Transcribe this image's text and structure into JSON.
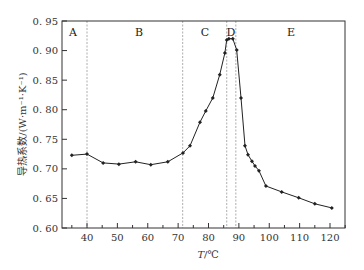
{
  "chart_data": {
    "type": "line",
    "title": "",
    "xlabel": "T/℃",
    "ylabel": "导热系数/(W·m⁻¹·K⁻¹)",
    "xlim": [
      33,
      125
    ],
    "ylim": [
      0.6,
      0.95
    ],
    "x_ticks": [
      40,
      50,
      60,
      70,
      80,
      90,
      100,
      110,
      120
    ],
    "y_ticks": [
      "0.60",
      "0.65",
      "0.70",
      "0.75",
      "0.80",
      "0.85",
      "0.90",
      "0.95"
    ],
    "grid": false,
    "legend": null,
    "region_boundaries": [
      40,
      71.5,
      86,
      89
    ],
    "regions": [
      "A",
      "B",
      "C",
      "D",
      "E"
    ],
    "series": [
      {
        "name": "thermal conductivity",
        "x": [
          35,
          40,
          45.3,
          50.5,
          56,
          61,
          66.6,
          71.6,
          73.9,
          77.2,
          79.1,
          81.4,
          83.7,
          85.4,
          86,
          86.7,
          88,
          89.3,
          90.7,
          92,
          93,
          94.3,
          95.3,
          96.6,
          98.9,
          104.1,
          109.7,
          115,
          120.6
        ],
        "y": [
          0.723,
          0.725,
          0.71,
          0.708,
          0.712,
          0.707,
          0.712,
          0.727,
          0.739,
          0.779,
          0.798,
          0.82,
          0.859,
          0.896,
          0.918,
          0.92,
          0.92,
          0.901,
          0.82,
          0.739,
          0.724,
          0.713,
          0.705,
          0.697,
          0.671,
          0.661,
          0.651,
          0.641,
          0.634
        ]
      }
    ]
  },
  "labels": {
    "xlabel_italic": "T",
    "xlabel_rest": "/℃",
    "ylabel": "导热系数/(W·m⁻¹·K⁻¹)"
  },
  "colors": {
    "line": "#222222",
    "axis": "#333333",
    "divider": "#999999"
  }
}
